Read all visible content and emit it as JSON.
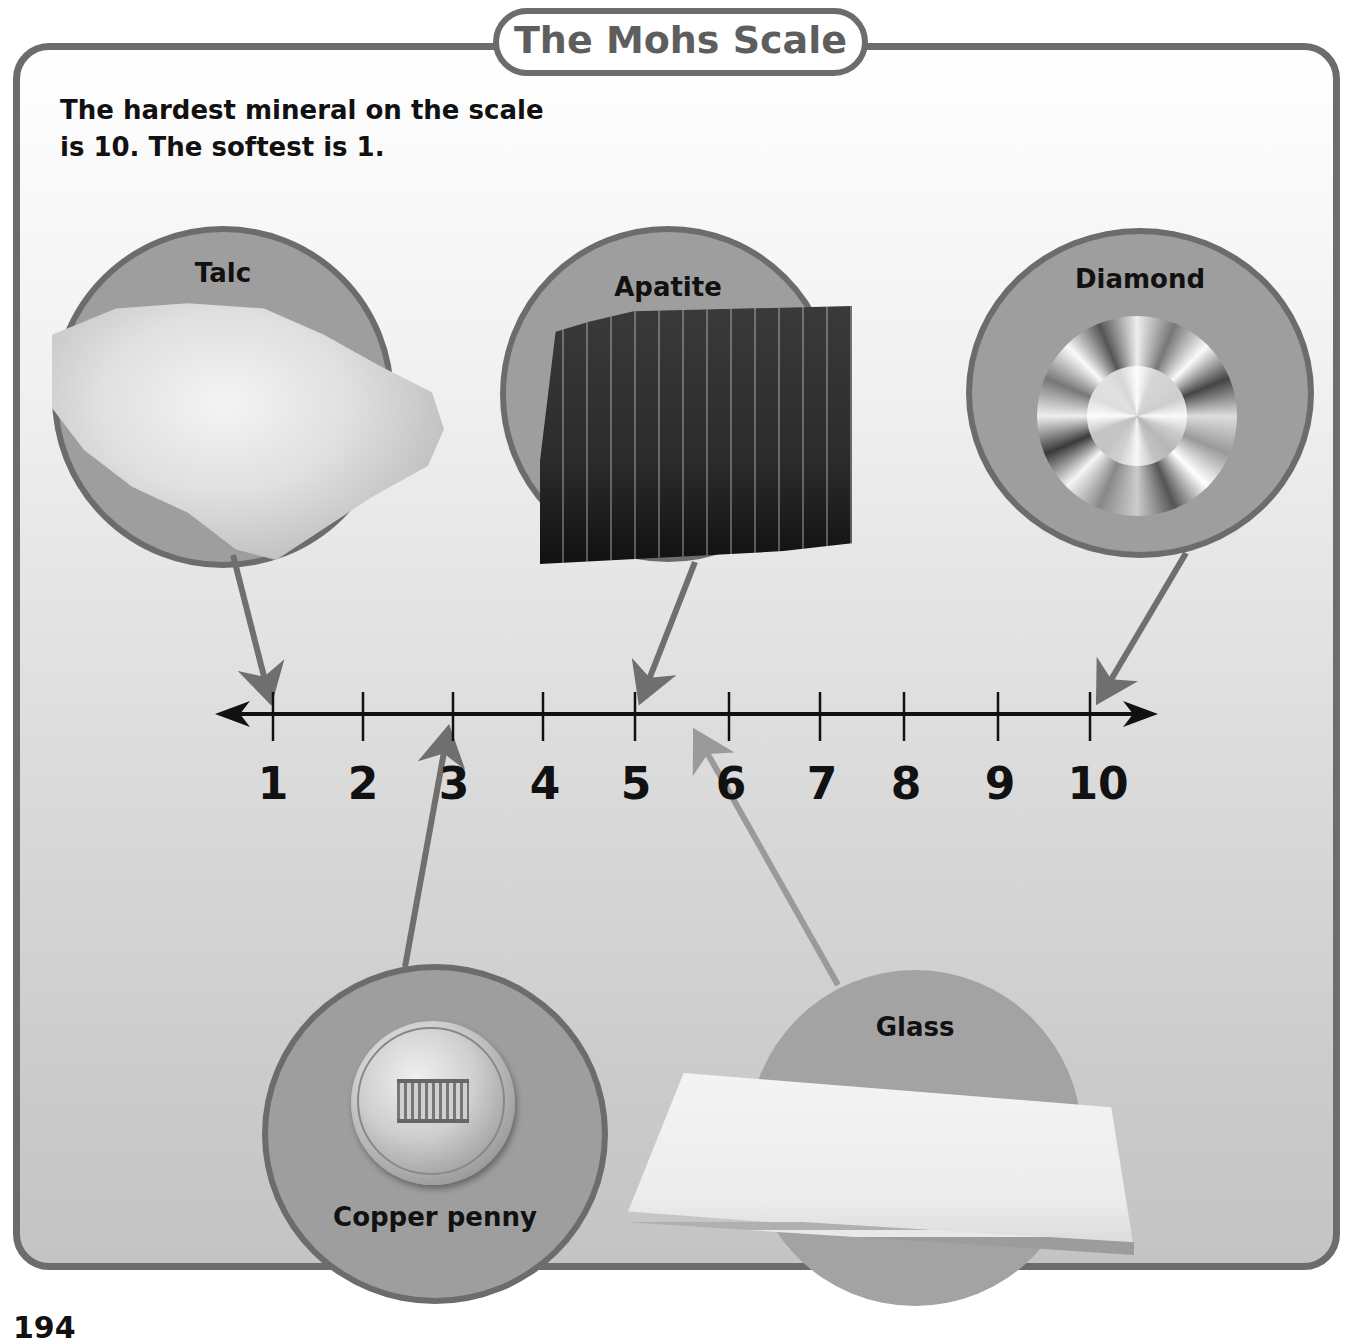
{
  "title": "The Mohs Scale",
  "intro": {
    "line1": "The hardest mineral on the scale",
    "line2": "is 10. The softest is 1."
  },
  "page_number": "194",
  "colors": {
    "frame_border": "#6c6c6c",
    "circle_fill": "#9e9e9e",
    "glass_circle_fill": "#a3a3a3",
    "arrow": "#6f6f6f",
    "glass_arrow": "#9a9a9a",
    "axis": "#111111",
    "title_text": "#5e5e5e"
  },
  "scale": {
    "ticks": [
      "1",
      "2",
      "3",
      "4",
      "5",
      "6",
      "7",
      "8",
      "9",
      "10"
    ],
    "min": 1,
    "max": 10
  },
  "minerals": [
    {
      "name": "Talc",
      "hardness": 1,
      "position": "top-left"
    },
    {
      "name": "Apatite",
      "hardness": 5,
      "position": "top-center"
    },
    {
      "name": "Diamond",
      "hardness": 10,
      "position": "top-right"
    },
    {
      "name": "Copper penny",
      "hardness": 3,
      "position": "bottom-left"
    },
    {
      "name": "Glass",
      "hardness": 5.5,
      "position": "bottom-center"
    }
  ]
}
